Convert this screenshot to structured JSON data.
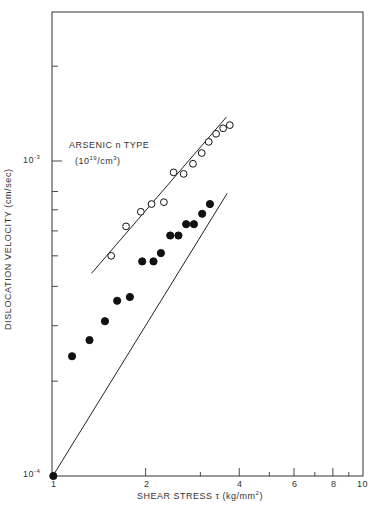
{
  "chart_data": {
    "type": "scatter",
    "title": "",
    "xlabel": "SHEAR STRESS τ (kg/mm²)",
    "ylabel": "DISLOCATION VELOCITY (cm/sec)",
    "xscale": "log",
    "yscale": "log",
    "xlim": [
      1,
      10
    ],
    "ylim": [
      0.0001,
      0.003
    ],
    "x_ticks": [
      "1",
      "2",
      "4",
      "6",
      "8",
      "10"
    ],
    "y_ticks": [
      "10^-4",
      "10^-3"
    ],
    "annotation": {
      "line1": "ARSENIC n TYPE",
      "line2": "(10^19/cm^3)"
    },
    "series": [
      {
        "name": "Arsenic n type (10^19/cm^3)",
        "marker": "open-circle",
        "points": [
          [
            1.55,
            0.0005
          ],
          [
            1.73,
            0.00062
          ],
          [
            1.93,
            0.00069
          ],
          [
            2.09,
            0.00073
          ],
          [
            2.29,
            0.00074
          ],
          [
            2.46,
            0.00092
          ],
          [
            2.65,
            0.00091
          ],
          [
            2.84,
            0.00098
          ],
          [
            3.03,
            0.00106
          ],
          [
            3.19,
            0.00115
          ],
          [
            3.37,
            0.00122
          ],
          [
            3.55,
            0.00127
          ],
          [
            3.73,
            0.0013
          ]
        ],
        "fit_line": [
          [
            1.34,
            0.00044
          ],
          [
            3.64,
            0.00138
          ]
        ]
      },
      {
        "name": "Undoped / reference",
        "marker": "filled-circle",
        "points": [
          [
            1.01,
            0.0001
          ],
          [
            1.16,
            0.00024
          ],
          [
            1.32,
            0.00027
          ],
          [
            1.48,
            0.00031
          ],
          [
            1.62,
            0.00036
          ],
          [
            1.78,
            0.00037
          ],
          [
            1.95,
            0.00048
          ],
          [
            2.12,
            0.00048
          ],
          [
            2.24,
            0.00051
          ],
          [
            2.4,
            0.00058
          ],
          [
            2.55,
            0.00058
          ],
          [
            2.7,
            0.00063
          ],
          [
            2.86,
            0.00063
          ],
          [
            3.04,
            0.00068
          ],
          [
            3.22,
            0.00073
          ]
        ],
        "fit_line": [
          [
            1.0,
            9.9e-05
          ],
          [
            3.66,
            0.00079
          ]
        ]
      }
    ],
    "grid": false,
    "legend": "inline annotation near upper-left of upper series"
  },
  "labels": {
    "ytick_top": "10",
    "ytick_top_exp": "-3",
    "ytick_bottom": "10",
    "ytick_bottom_exp": "-4",
    "annot_line1": "ARSENIC n TYPE",
    "annot_line2_a": "(10",
    "annot_line2_exp": "19",
    "annot_line2_b": "/cm",
    "annot_line2_exp2": "3",
    "annot_line2_c": ")",
    "ylabel": "DISLOCATION VELOCITY  (cm/sec)",
    "xlabel_a": "SHEAR STRESS  τ  (kg/mm",
    "xlabel_exp": "2",
    "xlabel_b": ")",
    "xt1": "1",
    "xt2": "2",
    "xt4": "4",
    "xt6": "6",
    "xt8": "8",
    "xt10": "10"
  }
}
